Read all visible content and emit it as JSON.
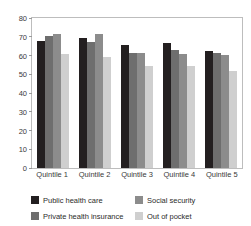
{
  "chart_data": {
    "type": "bar",
    "title": "",
    "xlabel": "",
    "ylabel": "",
    "ylim": [
      0,
      80
    ],
    "yticks": [
      80,
      70,
      60,
      50,
      40,
      30,
      20,
      10,
      0
    ],
    "grid": false,
    "legend_position": "bottom",
    "categories": [
      "Quintile 1",
      "Quintile 2",
      "Quintile 3",
      "Quintile 4",
      "Quintile 5"
    ],
    "series": [
      {
        "name": "Public health care",
        "color": "#231f20",
        "values": [
          67.5,
          69.5,
          65.5,
          66.5,
          62.5
        ]
      },
      {
        "name": "Private health insurance",
        "color": "#6e6e6e",
        "values": [
          70.5,
          67.0,
          61.5,
          63.0,
          61.5
        ]
      },
      {
        "name": "Social security",
        "color": "#8c8c8c",
        "values": [
          71.5,
          71.5,
          61.5,
          61.0,
          60.5
        ]
      },
      {
        "name": "Out of pocket",
        "color": "#cfcfcf",
        "values": [
          61.0,
          59.0,
          54.5,
          54.5,
          52.0
        ]
      }
    ]
  },
  "legend": {
    "items": [
      {
        "label": "Public health care",
        "color": "#231f20"
      },
      {
        "label": "Social security",
        "color": "#8c8c8c"
      },
      {
        "label": "Private health insurance",
        "color": "#6e6e6e"
      },
      {
        "label": "Out of pocket",
        "color": "#cfcfcf"
      }
    ]
  }
}
